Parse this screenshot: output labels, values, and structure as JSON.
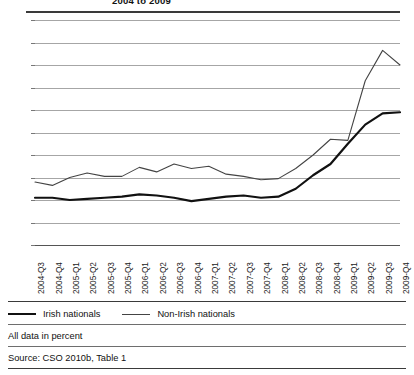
{
  "figure": {
    "title": "2004 to 2009",
    "title_cropped": true
  },
  "legend": {
    "items": [
      {
        "label": "Irish nationals",
        "style": "bold",
        "color": "#111111"
      },
      {
        "label": "Non-Irish nationals",
        "style": "thin",
        "color": "#444444"
      }
    ]
  },
  "footer": {
    "note": "All data in percent",
    "source": "Source: CSO 2010b, Table 1"
  },
  "chart_data": {
    "type": "line",
    "title": "2004 to 2009",
    "xlabel": "",
    "ylabel": "",
    "ylim": [
      0,
      20
    ],
    "ytick_step": 2,
    "yticks": [
      0,
      2,
      4,
      6,
      8,
      10,
      12,
      14,
      16,
      18,
      20
    ],
    "grid": true,
    "legend_position": "below",
    "units": "percent",
    "categories": [
      "2004-Q3",
      "2004-Q4",
      "2005-Q1",
      "2005-Q2",
      "2005-Q3",
      "2005-Q4",
      "2006-Q1",
      "2006-Q2",
      "2006-Q3",
      "2006-Q4",
      "2007-Q1",
      "2007-Q2",
      "2007-Q3",
      "2007-Q4",
      "2008-Q1",
      "2008-Q2",
      "2008-Q3",
      "2008-Q4",
      "2009-Q1",
      "2009-Q2",
      "2009-Q3",
      "2009-Q4"
    ],
    "series": [
      {
        "name": "Irish nationals",
        "color": "#111111",
        "width": 2.2,
        "values": [
          4.2,
          4.2,
          4.0,
          4.1,
          4.2,
          4.3,
          4.5,
          4.4,
          4.2,
          3.9,
          4.1,
          4.3,
          4.4,
          4.2,
          4.3,
          5.0,
          6.2,
          7.2,
          9.0,
          10.7,
          11.7,
          11.8
        ]
      },
      {
        "name": "Non-Irish nationals",
        "color": "#444444",
        "width": 1.1,
        "values": [
          5.6,
          5.3,
          6.0,
          6.4,
          6.1,
          6.1,
          6.9,
          6.5,
          7.2,
          6.8,
          7.0,
          6.3,
          6.1,
          5.8,
          5.9,
          6.8,
          8.0,
          9.4,
          9.3,
          14.6,
          17.3,
          16.0
        ]
      }
    ]
  }
}
